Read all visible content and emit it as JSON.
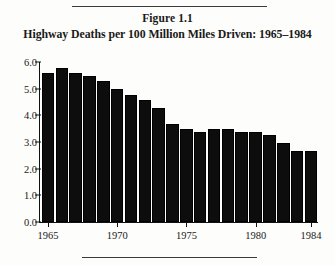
{
  "figure": {
    "label": "Figure 1.1",
    "title": "Highway Deaths per 100 Million Miles Driven: 1965–1984"
  },
  "chart_data": {
    "type": "bar",
    "title": "Highway Deaths per 100 Million Miles Driven: 1965–1984",
    "xlabel": "",
    "ylabel": "",
    "ylim": [
      0.0,
      6.0
    ],
    "ytick_labels": [
      "0.0",
      "1.0",
      "2.0",
      "3.0",
      "4.0",
      "5.0",
      "6.0"
    ],
    "ytick_values": [
      0.0,
      1.0,
      2.0,
      3.0,
      4.0,
      5.0,
      6.0
    ],
    "grid": false,
    "legend": null,
    "categories": [
      "1965",
      "1966",
      "1967",
      "1968",
      "1969",
      "1970",
      "1971",
      "1972",
      "1973",
      "1974",
      "1975",
      "1976",
      "1977",
      "1978",
      "1979",
      "1980",
      "1981",
      "1982",
      "1983",
      "1984"
    ],
    "xtick_labels": [
      "1965",
      "1970",
      "1975",
      "1980",
      "1984"
    ],
    "values": [
      5.5,
      5.7,
      5.5,
      5.4,
      5.2,
      4.9,
      4.7,
      4.5,
      4.2,
      3.6,
      3.4,
      3.3,
      3.4,
      3.4,
      3.3,
      3.3,
      3.2,
      2.9,
      2.6,
      2.6
    ],
    "bar_color": "#0d0d0d"
  }
}
